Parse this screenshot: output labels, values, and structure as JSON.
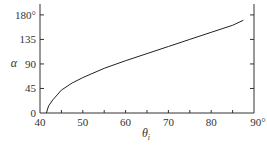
{
  "chart_data": {
    "type": "line",
    "title": "",
    "xlabel": "θi",
    "ylabel": "α",
    "xlim": [
      40,
      90
    ],
    "ylim": [
      0,
      200
    ],
    "x_ticks": [
      "40",
      "50",
      "60",
      "70",
      "80",
      "90°"
    ],
    "y_ticks": [
      "0",
      "45",
      "90",
      "135",
      "180°"
    ],
    "grid": false,
    "series": [
      {
        "name": "alpha vs theta_i",
        "x": [
          41.5,
          42,
          43,
          45,
          47.5,
          50,
          55,
          60,
          65,
          70,
          75,
          80,
          85,
          87.5
        ],
        "values": [
          0,
          13,
          24,
          42,
          55,
          65,
          82,
          96,
          109,
          122,
          135,
          148,
          161,
          170
        ]
      }
    ]
  }
}
